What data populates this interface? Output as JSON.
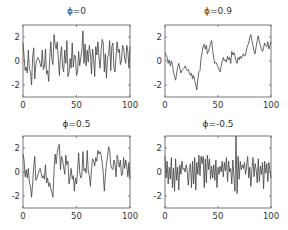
{
  "figure": {
    "layout": "2x2 grid of line plots",
    "panels_order": [
      "top-left",
      "top-right",
      "bottom-left",
      "bottom-right"
    ]
  },
  "chart_data": [
    {
      "type": "line",
      "title": "ϕ=0",
      "xlabel": "",
      "ylabel": "",
      "xlim": [
        0,
        100
      ],
      "ylim": [
        -3,
        3
      ],
      "xticks": [
        "0",
        "50",
        "100"
      ],
      "yticks": [
        "2",
        "0",
        "-2"
      ],
      "grid": false,
      "color": "#404040",
      "values": [
        1.5,
        0.4,
        -0.8,
        -0.5,
        -1.0,
        0.9,
        -0.7,
        -0.9,
        -2.0,
        0.3,
        1.1,
        -1.5,
        -0.3,
        0.1,
        0.3,
        0.1,
        -0.2,
        -0.5,
        0.9,
        -0.7,
        -0.5,
        1.0,
        -1.1,
        -0.8,
        -1.7,
        0.3,
        1.6,
        0.1,
        -0.3,
        2.2,
        1.4,
        1.0,
        1.6,
        0.2,
        -1.2,
        0.4,
        1.2,
        -0.5,
        -0.9,
        0.9,
        -0.2,
        1.7,
        -1.3,
        -1.0,
        0.2,
        -0.6,
        1.5,
        -0.5,
        0.5,
        0.4,
        -1.2,
        -0.9,
        0.8,
        -0.4,
        0.3,
        0.9,
        2.5,
        -0.2,
        1.4,
        -0.4,
        0.9,
        -0.1,
        1.3,
        0.6,
        -1.1,
        1.0,
        0.2,
        -1.3,
        1.2,
        0.5,
        1.6,
        0.3,
        -0.6,
        0.9,
        1.8,
        1.5,
        -0.9,
        0.6,
        -1.4,
        0.3,
        0.5,
        1.7,
        -0.8,
        1.2,
        1.5,
        -0.6,
        -0.9,
        0.4,
        1.6,
        0.7,
        1.0,
        -0.3,
        0.0,
        1.3,
        1.1,
        0.2,
        -0.2,
        1.3,
        0.8,
        -0.6,
        1.2
      ],
      "x": "0..100 step 1"
    },
    {
      "type": "line",
      "title": "ϕ=0.9",
      "xlabel": "",
      "ylabel": "",
      "xlim": [
        0,
        100
      ],
      "ylim": [
        -3,
        3
      ],
      "xticks": [
        "0",
        "50",
        "100"
      ],
      "yticks": [
        "2",
        "0",
        "-2"
      ],
      "grid": false,
      "color": "#404040",
      "values": [
        0.7,
        0.5,
        0.3,
        -0.2,
        0.1,
        -0.4,
        0.0,
        -0.3,
        -0.9,
        -1.3,
        -1.6,
        -1.0,
        -0.5,
        -0.2,
        -0.6,
        -1.0,
        -0.8,
        -0.7,
        -0.6,
        -0.4,
        -0.6,
        -0.8,
        -0.7,
        -1.0,
        -1.2,
        -1.0,
        -1.5,
        -1.2,
        -1.6,
        -2.0,
        -2.4,
        -1.5,
        -0.9,
        -0.8,
        0.2,
        0.7,
        1.2,
        1.4,
        1.0,
        1.3,
        0.6,
        0.8,
        1.1,
        1.5,
        1.7,
        0.9,
        0.2,
        -0.2,
        -0.1,
        -0.3,
        -0.5,
        -0.7,
        -0.9,
        -0.4,
        0.0,
        0.3,
        0.0,
        0.1,
        -0.1,
        0.4,
        0.1,
        0.3,
        -0.2,
        0.8,
        0.5,
        0.7,
        0.4,
        0.0,
        -0.2,
        0.3,
        0.1,
        0.4,
        0.2,
        0.4,
        0.6,
        0.4,
        0.5,
        1.0,
        1.3,
        1.5,
        2.0,
        2.2,
        1.7,
        1.3,
        0.8,
        0.6,
        1.2,
        1.7,
        2.1,
        1.6,
        1.3,
        1.0,
        0.8,
        1.1,
        1.5,
        1.3,
        1.2,
        1.6,
        1.0,
        1.3,
        1.6
      ],
      "x": "0..100 step 1"
    },
    {
      "type": "line",
      "title": "ϕ=0.5",
      "xlabel": "",
      "ylabel": "",
      "xlim": [
        0,
        100
      ],
      "ylim": [
        -3,
        3
      ],
      "xticks": [
        "0",
        "50",
        "100"
      ],
      "yticks": [
        "2",
        "0",
        "-2"
      ],
      "grid": false,
      "color": "#404040",
      "values": [
        1.5,
        1.0,
        -0.4,
        0.2,
        -0.5,
        0.3,
        -0.9,
        -1.2,
        -2.1,
        -1.0,
        0.4,
        1.3,
        -0.7,
        -0.5,
        -0.2,
        0.1,
        0.3,
        -0.1,
        -0.5,
        -0.3,
        -0.6,
        0.6,
        -0.9,
        -0.5,
        -1.2,
        -0.9,
        -1.4,
        -1.7,
        -2.1,
        0.1,
        1.5,
        0.7,
        1.6,
        2.1,
        2.3,
        0.2,
        1.3,
        1.0,
        0.4,
        -0.2,
        1.4,
        0.6,
        0.9,
        -1.0,
        -0.4,
        0.3,
        -0.6,
        -0.3,
        -1.6,
        -0.5,
        -1.0,
        0.1,
        1.6,
        0.0,
        -0.5,
        -0.3,
        1.7,
        0.1,
        0.3,
        -0.1,
        1.8,
        0.1,
        -0.3,
        -1.2,
        0.2,
        1.1,
        1.0,
        0.5,
        1.2,
        0.9,
        1.8,
        1.5,
        1.7,
        1.4,
        0.8,
        -0.1,
        -1.6,
        -0.3,
        0.7,
        1.3,
        2.1,
        1.8,
        0.6,
        0.3,
        0.2,
        1.0,
        0.6,
        -0.4,
        1.4,
        0.9,
        0.4,
        1.0,
        -0.3,
        -0.2,
        1.2,
        0.3,
        1.0,
        0.5,
        -0.4,
        0.8,
        -0.6
      ],
      "x": "0..100 step 1"
    },
    {
      "type": "line",
      "title": "ϕ=-0.5",
      "xlabel": "",
      "ylabel": "",
      "xlim": [
        0,
        100
      ],
      "ylim": [
        -3,
        3
      ],
      "xticks": [
        "0",
        "50",
        "100"
      ],
      "yticks": [
        "2",
        "0",
        "-2"
      ],
      "grid": false,
      "color": "#404040",
      "values": [
        1.3,
        -0.5,
        0.9,
        -1.0,
        0.4,
        -0.6,
        1.2,
        -1.3,
        0.3,
        -1.6,
        1.1,
        -0.7,
        0.4,
        -1.5,
        0.6,
        -0.2,
        0.9,
        0.2,
        0.3,
        0.0,
        0.6,
        0.1,
        -1.1,
        0.2,
        0.7,
        -1.3,
        0.9,
        -1.0,
        1.2,
        -1.5,
        0.8,
        -0.2,
        1.4,
        -0.3,
        1.3,
        0.7,
        1.3,
        -1.3,
        1.1,
        -0.9,
        1.4,
        0.2,
        1.1,
        -0.6,
        0.5,
        -0.5,
        0.6,
        -0.7,
        1.0,
        -1.3,
        0.4,
        -0.2,
        0.5,
        0.0,
        0.9,
        -0.4,
        0.8,
        0.1,
        1.2,
        -0.8,
        0.9,
        0.0,
        0.3,
        -1.0,
        1.0,
        -0.4,
        -1.6,
        3.0,
        -1.8,
        1.3,
        -0.6,
        0.9,
        0.2,
        0.6,
        0.3,
        0.8,
        -0.2,
        0.5,
        1.3,
        -0.5,
        0.4,
        -1.2,
        0.2,
        1.2,
        -0.4,
        0.7,
        0.2,
        -0.9,
        1.1,
        -0.8,
        0.5,
        -0.2,
        0.8,
        -1.4,
        0.9,
        -0.1,
        0.7,
        -0.8,
        0.8,
        0.1,
        -0.5
      ],
      "x": "0..100 step 1"
    }
  ]
}
